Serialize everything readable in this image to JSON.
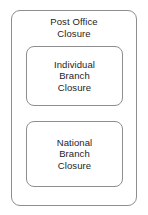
{
  "diagram": {
    "type": "nested-boxes",
    "title": "Post Office Closure",
    "outer_box": {
      "label": "Post Office\nClosure",
      "label_line_1": "Post Office",
      "label_line_2": "Closure",
      "border_color": "#8e8e8e",
      "fill_color": "#ffffff"
    },
    "inner_boxes": [
      {
        "label": "Individual\nBranch\nClosure",
        "label_line_1": "Individual",
        "label_line_2": "Branch",
        "label_line_3": "Closure",
        "border_color": "#8e8e8e",
        "fill_color": "#ffffff"
      },
      {
        "label": "National\nBranch\nClosure",
        "label_line_1": "National",
        "label_line_2": "Branch",
        "label_line_3": "Closure",
        "border_color": "#8e8e8e",
        "fill_color": "#ffffff"
      }
    ],
    "text_color": "#1d1d1d",
    "background_color": "#ffffff"
  }
}
